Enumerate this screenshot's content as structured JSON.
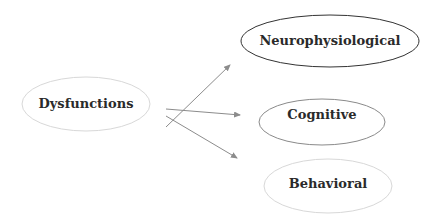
{
  "diagram": {
    "source": {
      "label": "Dysfunctions",
      "stroke": "#d8d8d8"
    },
    "targets": [
      {
        "label": "Neurophysiological",
        "stroke": "#333333"
      },
      {
        "label": "Cognitive",
        "stroke": "#8a8a8a"
      },
      {
        "label": "Behavioral",
        "stroke": "#d8d8d8"
      }
    ],
    "arrow_color": "#8c8c8c"
  }
}
